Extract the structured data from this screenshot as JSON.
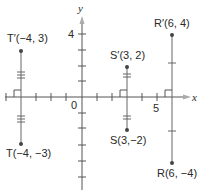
{
  "axes": {
    "x_label": "x",
    "y_label": "y",
    "origin_label": "0",
    "x_tick_label": "5",
    "y_tick_label": "4",
    "x_range": [
      -4,
      7
    ],
    "y_range": [
      -5,
      5
    ]
  },
  "points": [
    {
      "id": "T_prime",
      "label": "T′(−4, 3)",
      "x": -4,
      "y": 3
    },
    {
      "id": "T",
      "label": "T(−4, −3)",
      "x": -4,
      "y": -3
    },
    {
      "id": "S_prime",
      "label": "S′(3, 2)",
      "x": 3,
      "y": 2
    },
    {
      "id": "S",
      "label": "S(3,−2)",
      "x": 3,
      "y": -2
    },
    {
      "id": "R_prime",
      "label": "R′(6, 4)",
      "x": 6,
      "y": 4
    },
    {
      "id": "R",
      "label": "R(6, −4)",
      "x": 6,
      "y": -4
    }
  ],
  "segments": [
    {
      "from": "T_prime",
      "to": "T",
      "congruence_marks": 3
    },
    {
      "from": "S_prime",
      "to": "S",
      "congruence_marks": 2
    },
    {
      "from": "R_prime",
      "to": "R",
      "congruence_marks": 1
    }
  ],
  "colors": {
    "axis": "#555555",
    "segment": "#666666",
    "point": "#444444",
    "arrow": "#aaaaaa"
  }
}
